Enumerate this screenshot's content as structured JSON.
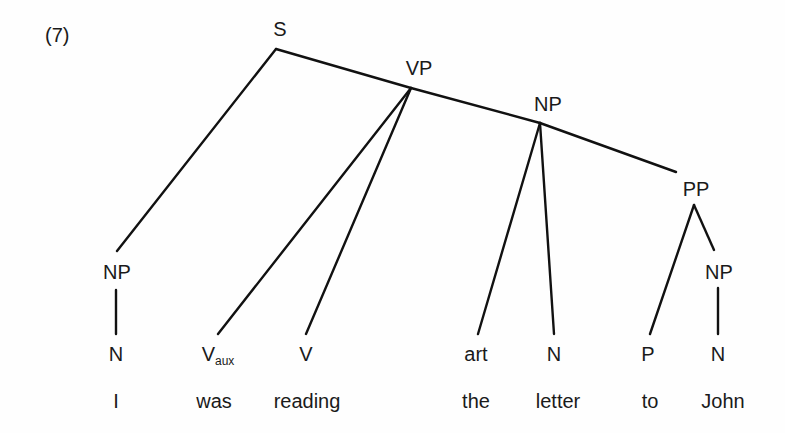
{
  "example_number": "(7)",
  "nodes": {
    "s": "S",
    "vp": "VP",
    "np_object": "NP",
    "pp": "PP",
    "np_subject": "NP",
    "np_pp_object": "NP",
    "n_subject": "N",
    "v_aux": "V",
    "v_aux_subscript": "aux",
    "v_main": "V",
    "art": "art",
    "n_object": "N",
    "p": "P",
    "n_pp_object": "N"
  },
  "words": [
    "I",
    "was",
    "reading",
    "the",
    "letter",
    "to",
    "John"
  ],
  "tree": {
    "label": "S",
    "children": [
      {
        "label": "NP",
        "children": [
          {
            "label": "N",
            "word": "I"
          }
        ]
      },
      {
        "label": "VP",
        "children": [
          {
            "label": "V_aux",
            "word": "was"
          },
          {
            "label": "V",
            "word": "reading"
          },
          {
            "label": "NP",
            "children": [
              {
                "label": "art",
                "word": "the"
              },
              {
                "label": "N",
                "word": "letter"
              },
              {
                "label": "PP",
                "children": [
                  {
                    "label": "P",
                    "word": "to"
                  },
                  {
                    "label": "NP",
                    "children": [
                      {
                        "label": "N",
                        "word": "John"
                      }
                    ]
                  }
                ]
              }
            ]
          }
        ]
      }
    ]
  }
}
